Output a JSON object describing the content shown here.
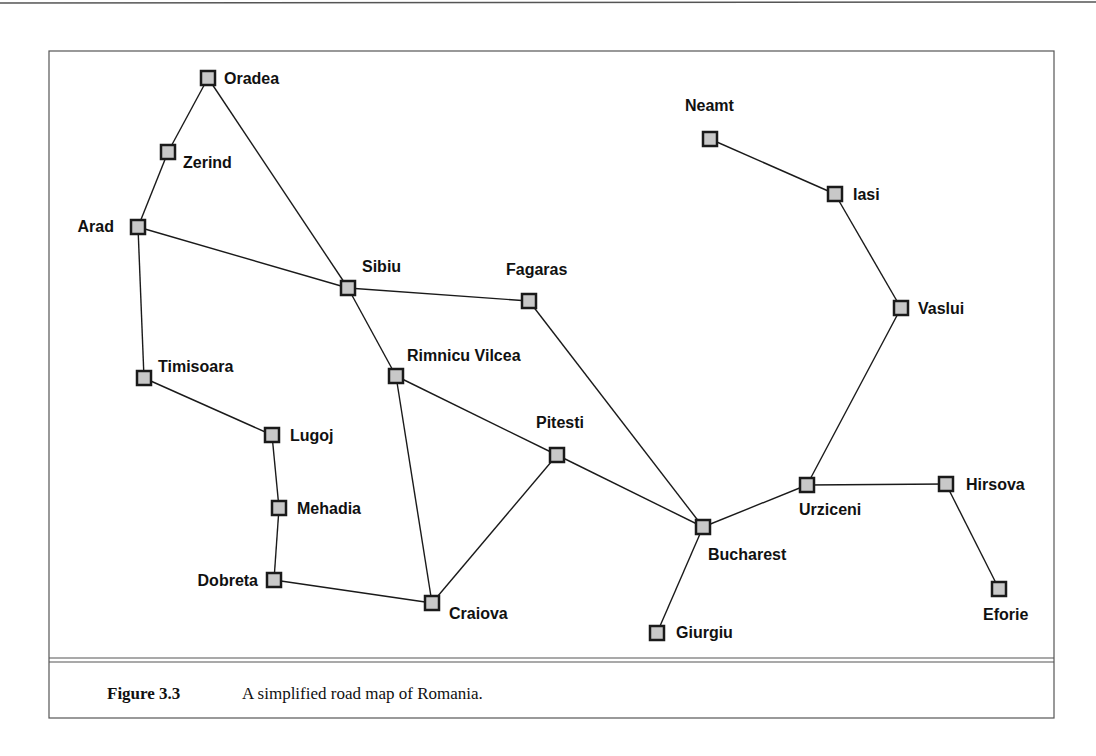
{
  "figure": {
    "number": "Figure 3.3",
    "caption": "A simplified road map of Romania."
  },
  "colors": {
    "node_fill": "#c8c8c8",
    "stroke": "#1a1a1a",
    "frame": "#555555"
  },
  "nodes": [
    {
      "id": "Oradea",
      "x": 208,
      "y": 78,
      "lx": 224,
      "ly": 84,
      "anchor": "start"
    },
    {
      "id": "Zerind",
      "x": 168,
      "y": 152,
      "lx": 183,
      "ly": 168,
      "anchor": "start"
    },
    {
      "id": "Arad",
      "x": 138,
      "y": 227,
      "lx": 114,
      "ly": 232,
      "anchor": "end"
    },
    {
      "id": "Timisoara",
      "x": 144,
      "y": 378,
      "lx": 158,
      "ly": 372,
      "anchor": "start"
    },
    {
      "id": "Lugoj",
      "x": 272,
      "y": 435,
      "lx": 290,
      "ly": 441,
      "anchor": "start"
    },
    {
      "id": "Mehadia",
      "x": 279,
      "y": 508,
      "lx": 297,
      "ly": 514,
      "anchor": "start"
    },
    {
      "id": "Dobreta",
      "x": 274,
      "y": 580,
      "lx": 258,
      "ly": 586,
      "anchor": "end"
    },
    {
      "id": "Craiova",
      "x": 432,
      "y": 603,
      "lx": 449,
      "ly": 619,
      "anchor": "start"
    },
    {
      "id": "Sibiu",
      "x": 348,
      "y": 288,
      "lx": 362,
      "ly": 272,
      "anchor": "start"
    },
    {
      "id": "Rimnicu Vilcea",
      "x": 396,
      "y": 376,
      "lx": 407,
      "ly": 361,
      "anchor": "start"
    },
    {
      "id": "Fagaras",
      "x": 529,
      "y": 301,
      "lx": 506,
      "ly": 275,
      "anchor": "start"
    },
    {
      "id": "Pitesti",
      "x": 557,
      "y": 455,
      "lx": 536,
      "ly": 428,
      "anchor": "start"
    },
    {
      "id": "Bucharest",
      "x": 703,
      "y": 527,
      "lx": 708,
      "ly": 560,
      "anchor": "start"
    },
    {
      "id": "Giurgiu",
      "x": 657,
      "y": 633,
      "lx": 676,
      "ly": 638,
      "anchor": "start"
    },
    {
      "id": "Urziceni",
      "x": 807,
      "y": 485,
      "lx": 799,
      "ly": 515,
      "anchor": "start"
    },
    {
      "id": "Hirsova",
      "x": 946,
      "y": 484,
      "lx": 966,
      "ly": 490,
      "anchor": "start"
    },
    {
      "id": "Eforie",
      "x": 999,
      "y": 589,
      "lx": 983,
      "ly": 620,
      "anchor": "start"
    },
    {
      "id": "Vaslui",
      "x": 901,
      "y": 308,
      "lx": 918,
      "ly": 314,
      "anchor": "start"
    },
    {
      "id": "Iasi",
      "x": 835,
      "y": 194,
      "lx": 853,
      "ly": 200,
      "anchor": "start"
    },
    {
      "id": "Neamt",
      "x": 710,
      "y": 139,
      "lx": 685,
      "ly": 111,
      "anchor": "start"
    }
  ],
  "edges": [
    [
      "Oradea",
      "Zerind"
    ],
    [
      "Zerind",
      "Arad"
    ],
    [
      "Oradea",
      "Sibiu"
    ],
    [
      "Arad",
      "Sibiu"
    ],
    [
      "Arad",
      "Timisoara"
    ],
    [
      "Timisoara",
      "Lugoj"
    ],
    [
      "Lugoj",
      "Mehadia"
    ],
    [
      "Mehadia",
      "Dobreta"
    ],
    [
      "Dobreta",
      "Craiova"
    ],
    [
      "Sibiu",
      "Fagaras"
    ],
    [
      "Sibiu",
      "Rimnicu Vilcea"
    ],
    [
      "Rimnicu Vilcea",
      "Craiova"
    ],
    [
      "Rimnicu Vilcea",
      "Pitesti"
    ],
    [
      "Craiova",
      "Pitesti"
    ],
    [
      "Pitesti",
      "Bucharest"
    ],
    [
      "Fagaras",
      "Bucharest"
    ],
    [
      "Bucharest",
      "Giurgiu"
    ],
    [
      "Bucharest",
      "Urziceni"
    ],
    [
      "Urziceni",
      "Hirsova"
    ],
    [
      "Hirsova",
      "Eforie"
    ],
    [
      "Urziceni",
      "Vaslui"
    ],
    [
      "Vaslui",
      "Iasi"
    ],
    [
      "Iasi",
      "Neamt"
    ]
  ]
}
